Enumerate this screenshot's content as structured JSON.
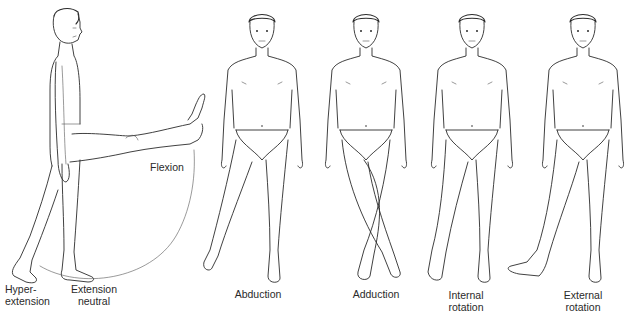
{
  "diagram": {
    "title": "",
    "background": "#ffffff",
    "line_color": "#2b2b2b",
    "figures": [
      {
        "id": "side-flexion",
        "view": "side",
        "labels": [
          "Hyper-extension",
          "Extension neutral",
          "Flexion"
        ]
      },
      {
        "id": "abduction",
        "view": "front",
        "label": "Abduction"
      },
      {
        "id": "adduction",
        "view": "front",
        "label": "Adduction"
      },
      {
        "id": "internal-rotation",
        "view": "front",
        "label": "Internal rotation"
      },
      {
        "id": "external-rotation",
        "view": "front",
        "label": "External rotation"
      }
    ],
    "labels": {
      "hyper_line1": "Hyper-",
      "hyper_line2": "extension",
      "ext_line1": "Extension",
      "ext_line2": "neutral",
      "flexion": "Flexion",
      "abduction": "Abduction",
      "adduction": "Adduction",
      "internal_line1": "Internal",
      "internal_line2": "rotation",
      "external_line1": "External",
      "external_line2": "rotation"
    }
  }
}
